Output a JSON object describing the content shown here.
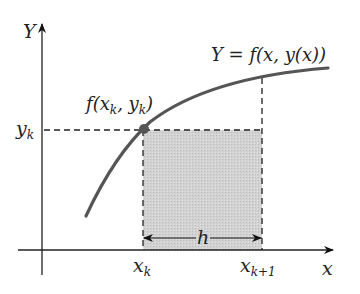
{
  "diagram": {
    "axis_y_label": "Y",
    "axis_x_label": "x",
    "curve_label": "Y = f(x, y(x))",
    "point_label": "f(x_k, y_k)",
    "point_label_parts": {
      "f": "f(",
      "x": "x",
      "k1": "k",
      "sep": ", ",
      "y": "y",
      "k2": "k",
      "close": ")"
    },
    "curve_label_parts": {
      "lhs": "Y",
      "eq": " = ",
      "rhs": "f(x, y(x))"
    },
    "yk_label": {
      "base": "y",
      "sub": "k"
    },
    "xk_label": {
      "base": "x",
      "sub": "k"
    },
    "xk1_label": {
      "base": "x",
      "sub": "k+1"
    },
    "step_label": "h",
    "colors": {
      "curve": "#555555",
      "axis": "#222222",
      "shade": "#cfcfcf",
      "point": "#555555"
    }
  }
}
